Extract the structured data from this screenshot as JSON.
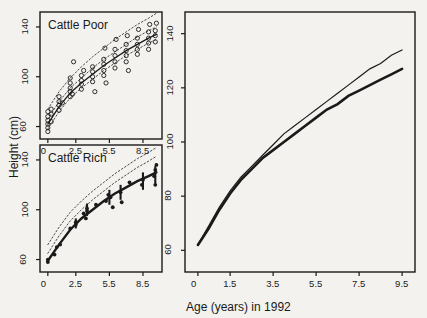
{
  "figure": {
    "y_axis_title": "Height (cm)",
    "x_axis_title": "Age (years) in 1992",
    "background_color": "#f3f2ef",
    "ink_color": "#1a1a1a"
  },
  "chart_data": [
    {
      "type": "scatter",
      "title": "Cattle Poor",
      "panel": "top-left",
      "xlabel": "",
      "ylabel": "Height (cm)",
      "xlim": [
        -0.7,
        10.2
      ],
      "ylim": [
        50,
        152
      ],
      "xticks": [
        0,
        2.5,
        5.5,
        8.5
      ],
      "yticks": [
        60,
        100,
        140
      ],
      "grid": false,
      "legend": "none",
      "marker": "open-circle",
      "points": [
        {
          "x": 0.0,
          "y": 56
        },
        {
          "x": 0.0,
          "y": 59
        },
        {
          "x": 0.0,
          "y": 62
        },
        {
          "x": 0.0,
          "y": 65
        },
        {
          "x": 0.0,
          "y": 68
        },
        {
          "x": 0.0,
          "y": 72
        },
        {
          "x": 0.3,
          "y": 64
        },
        {
          "x": 0.3,
          "y": 70
        },
        {
          "x": 0.3,
          "y": 74
        },
        {
          "x": 1.0,
          "y": 73
        },
        {
          "x": 1.0,
          "y": 77
        },
        {
          "x": 1.0,
          "y": 80
        },
        {
          "x": 1.0,
          "y": 84
        },
        {
          "x": 1.3,
          "y": 79
        },
        {
          "x": 2.0,
          "y": 84
        },
        {
          "x": 2.0,
          "y": 88
        },
        {
          "x": 2.0,
          "y": 91
        },
        {
          "x": 2.0,
          "y": 95
        },
        {
          "x": 2.0,
          "y": 99
        },
        {
          "x": 2.2,
          "y": 86
        },
        {
          "x": 2.3,
          "y": 112
        },
        {
          "x": 3.0,
          "y": 90
        },
        {
          "x": 3.0,
          "y": 94
        },
        {
          "x": 3.0,
          "y": 97
        },
        {
          "x": 3.0,
          "y": 101
        },
        {
          "x": 3.2,
          "y": 105
        },
        {
          "x": 4.0,
          "y": 96
        },
        {
          "x": 4.0,
          "y": 100
        },
        {
          "x": 4.0,
          "y": 104
        },
        {
          "x": 4.0,
          "y": 108
        },
        {
          "x": 4.2,
          "y": 88
        },
        {
          "x": 5.0,
          "y": 101
        },
        {
          "x": 5.0,
          "y": 105
        },
        {
          "x": 5.0,
          "y": 110
        },
        {
          "x": 5.0,
          "y": 114
        },
        {
          "x": 5.1,
          "y": 123
        },
        {
          "x": 5.2,
          "y": 95
        },
        {
          "x": 6.0,
          "y": 107
        },
        {
          "x": 6.0,
          "y": 112
        },
        {
          "x": 6.0,
          "y": 117
        },
        {
          "x": 6.0,
          "y": 122
        },
        {
          "x": 6.1,
          "y": 130
        },
        {
          "x": 7.0,
          "y": 112
        },
        {
          "x": 7.0,
          "y": 117
        },
        {
          "x": 7.0,
          "y": 121
        },
        {
          "x": 7.0,
          "y": 126
        },
        {
          "x": 7.1,
          "y": 133
        },
        {
          "x": 7.2,
          "y": 105
        },
        {
          "x": 8.0,
          "y": 118
        },
        {
          "x": 8.0,
          "y": 122
        },
        {
          "x": 8.0,
          "y": 126
        },
        {
          "x": 8.0,
          "y": 131
        },
        {
          "x": 8.1,
          "y": 138
        },
        {
          "x": 9.0,
          "y": 122
        },
        {
          "x": 9.0,
          "y": 127
        },
        {
          "x": 9.0,
          "y": 131
        },
        {
          "x": 9.0,
          "y": 136
        },
        {
          "x": 9.1,
          "y": 142
        },
        {
          "x": 9.6,
          "y": 128
        },
        {
          "x": 9.6,
          "y": 133
        },
        {
          "x": 9.6,
          "y": 137
        },
        {
          "x": 9.7,
          "y": 143
        }
      ],
      "fit_curve": {
        "name": "fitted mean",
        "style": "solid",
        "x": [
          0,
          1,
          2,
          3,
          4,
          5,
          6,
          7,
          8,
          9,
          9.7
        ],
        "y": [
          62,
          76,
          87,
          95,
          102,
          109,
          115,
          121,
          126,
          131,
          134
        ]
      },
      "reference_curves": [
        {
          "name": "upper reference",
          "style": "dotted",
          "x": [
            0,
            1,
            2,
            3,
            4,
            5,
            6,
            7,
            8,
            9,
            9.7
          ],
          "y": [
            74,
            88,
            99,
            108,
            116,
            123,
            130,
            136,
            142,
            147,
            151
          ]
        },
        {
          "name": "mid reference",
          "style": "dotted",
          "x": [
            0,
            1,
            2,
            3,
            4,
            5,
            6,
            7,
            8,
            9,
            9.7
          ],
          "y": [
            66,
            80,
            91,
            99,
            107,
            114,
            120,
            126,
            132,
            137,
            140
          ]
        },
        {
          "name": "lower reference",
          "style": "dotted",
          "x": [
            0,
            1,
            2,
            3,
            4,
            5,
            6,
            7,
            8,
            9,
            9.7
          ],
          "y": [
            58,
            72,
            83,
            91,
            98,
            105,
            111,
            117,
            122,
            127,
            130
          ]
        }
      ]
    },
    {
      "type": "scatter",
      "title": "Cattle Rich",
      "panel": "bottom-left",
      "xlabel": "Age (years) in 1992",
      "ylabel": "Height (cm)",
      "xlim": [
        -0.7,
        10.2
      ],
      "ylim": [
        50,
        152
      ],
      "xticks": [
        0,
        2.5,
        5.5,
        8.5
      ],
      "yticks": [
        60,
        100,
        140
      ],
      "grid": false,
      "legend": "none",
      "marker": "filled-circle",
      "points": [
        {
          "x": 0.0,
          "y": 58
        },
        {
          "x": 0.0,
          "y": 60
        },
        {
          "x": 0.6,
          "y": 64
        },
        {
          "x": 0.8,
          "y": 70
        },
        {
          "x": 1.1,
          "y": 72
        },
        {
          "x": 2.0,
          "y": 85
        },
        {
          "x": 2.5,
          "y": 88
        },
        {
          "x": 2.5,
          "y": 90
        },
        {
          "x": 3.2,
          "y": 97
        },
        {
          "x": 3.4,
          "y": 93
        },
        {
          "x": 3.5,
          "y": 99
        },
        {
          "x": 3.5,
          "y": 101
        },
        {
          "x": 4.3,
          "y": 104
        },
        {
          "x": 5.2,
          "y": 107
        },
        {
          "x": 5.4,
          "y": 112
        },
        {
          "x": 5.6,
          "y": 110
        },
        {
          "x": 5.8,
          "y": 102
        },
        {
          "x": 6.5,
          "y": 114
        },
        {
          "x": 6.6,
          "y": 106
        },
        {
          "x": 7.3,
          "y": 122
        },
        {
          "x": 8.4,
          "y": 120
        },
        {
          "x": 8.5,
          "y": 124
        },
        {
          "x": 9.5,
          "y": 127
        },
        {
          "x": 9.6,
          "y": 132
        },
        {
          "x": 9.6,
          "y": 120
        },
        {
          "x": 9.7,
          "y": 136
        }
      ],
      "error_bars": [
        {
          "x": 2.5,
          "y": 89,
          "low": 85,
          "high": 93
        },
        {
          "x": 3.5,
          "y": 100,
          "low": 95,
          "high": 105
        },
        {
          "x": 5.5,
          "y": 110,
          "low": 104,
          "high": 116
        },
        {
          "x": 6.5,
          "y": 114,
          "low": 108,
          "high": 120
        },
        {
          "x": 8.5,
          "y": 123,
          "low": 116,
          "high": 130
        },
        {
          "x": 9.6,
          "y": 128,
          "low": 121,
          "high": 135
        }
      ],
      "fit_curve": {
        "name": "fitted mean",
        "style": "solid-thick",
        "x": [
          0,
          1,
          2,
          3,
          4,
          5,
          6,
          7,
          8,
          9,
          9.7
        ],
        "y": [
          59,
          72,
          84,
          93,
          100,
          107,
          113,
          118,
          123,
          127,
          130
        ]
      },
      "reference_curves": [
        {
          "name": "upper reference",
          "style": "dotted",
          "x": [
            0,
            1,
            2,
            3,
            4,
            5,
            6,
            7,
            8,
            9,
            9.7
          ],
          "y": [
            72,
            86,
            98,
            107,
            115,
            122,
            129,
            135,
            141,
            146,
            150
          ]
        },
        {
          "name": "lower reference",
          "style": "dotted",
          "x": [
            0,
            1,
            2,
            3,
            4,
            5,
            6,
            7,
            8,
            9,
            9.7
          ],
          "y": [
            65,
            79,
            91,
            100,
            108,
            115,
            122,
            128,
            134,
            139,
            143
          ]
        }
      ]
    },
    {
      "type": "line",
      "title": "",
      "panel": "right",
      "xlabel": "Age (years) in 1992",
      "ylabel": "",
      "xlim": [
        -0.6,
        10.1
      ],
      "ylim": [
        52,
        148
      ],
      "xticks": [
        0,
        1.5,
        3.5,
        5.5,
        7.5,
        9.5
      ],
      "yticks": [
        60,
        80,
        100,
        120,
        140
      ],
      "grid": false,
      "legend": "none",
      "series": [
        {
          "name": "Cattle Poor",
          "style": "thin",
          "x": [
            0,
            0.5,
            1,
            1.5,
            2,
            2.5,
            3,
            3.5,
            4,
            4.5,
            5,
            5.5,
            6,
            6.5,
            7,
            7.5,
            8,
            8.5,
            9,
            9.5
          ],
          "y": [
            62,
            69,
            76,
            82,
            87,
            91,
            95,
            99,
            103,
            106,
            109,
            112,
            115,
            118,
            121,
            124,
            127,
            129,
            132,
            134
          ]
        },
        {
          "name": "Cattle Rich",
          "style": "thick",
          "x": [
            0,
            0.5,
            1,
            1.5,
            2,
            2.5,
            3,
            3.5,
            4,
            4.5,
            5,
            5.5,
            6,
            6.5,
            7,
            7.5,
            8,
            8.5,
            9,
            9.5
          ],
          "y": [
            62,
            68,
            75,
            81,
            86,
            90,
            94,
            97,
            100,
            103,
            106,
            109,
            112,
            114,
            117,
            119,
            121,
            123,
            125,
            127
          ]
        }
      ]
    }
  ]
}
